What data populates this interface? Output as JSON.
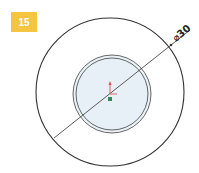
{
  "badge": {
    "label": "15",
    "color": "#f5c542"
  },
  "drawing": {
    "dimension_label": "⌀30",
    "colors": {
      "outline": "#333333",
      "inner_fill": "#e6f0f6",
      "origin_x_axis": "#d9534f",
      "origin_point": "#2e8b57"
    }
  }
}
